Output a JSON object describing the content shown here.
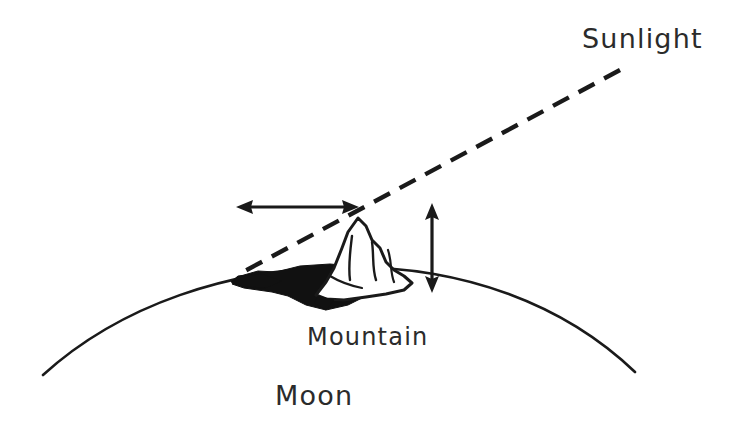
{
  "figure": {
    "title_text": "",
    "background_color": "#ffffff",
    "ink_color": "#1a1a1a",
    "shadow_fill_color": "#111111",
    "text_color": "#2b2b2b"
  },
  "labels": {
    "sunlight": "Sunlight",
    "mountain": "Mountain",
    "moon": "Moon"
  },
  "annotations": {
    "shadow_length_arrow": "horizontal-double-headed-arrow",
    "mountain_height_arrow": "vertical-double-headed-arrow",
    "sun_ray": "dashed-line"
  },
  "diagram_data": {
    "type": "schematic",
    "subject": "Measuring lunar mountain height from shadow length at the terminator",
    "elements": [
      {
        "name": "moon-limb",
        "kind": "arc",
        "description": "Curved surface of the Moon spanning the lower portion of the figure",
        "start_point": [
          43,
          375
        ],
        "end_point": [
          635,
          372
        ],
        "apex_point": [
          345,
          268
        ]
      },
      {
        "name": "sun-ray",
        "kind": "dashed-line",
        "description": "Grazing sunlight ray tangent at the mountain peak, continuing to the shadow tip",
        "start_point": [
          620,
          70
        ],
        "end_point": [
          243,
          272
        ],
        "dash_pattern": [
          18,
          11
        ]
      },
      {
        "name": "mountain",
        "kind": "outline-polygon",
        "description": "Hand-drawn peak rising above the lunar limb with interior ridge strokes",
        "peak_point": [
          358,
          218
        ],
        "base_left_point": [
          318,
          298
        ],
        "base_right_point": [
          412,
          282
        ]
      },
      {
        "name": "mountain-shadow",
        "kind": "filled-wedge",
        "description": "Solid black shadow cast westward from the mountain base along the surface",
        "tip_point": [
          237,
          277
        ],
        "base_point": [
          365,
          290
        ]
      },
      {
        "name": "shadow-length-arrow",
        "kind": "double-headed-arrow",
        "orientation": "horizontal",
        "from_point": [
          238,
          207
        ],
        "to_point": [
          357,
          207
        ]
      },
      {
        "name": "mountain-height-arrow",
        "kind": "double-headed-arrow",
        "orientation": "vertical",
        "from_point": [
          432,
          205
        ],
        "to_point": [
          432,
          291
        ]
      }
    ]
  }
}
